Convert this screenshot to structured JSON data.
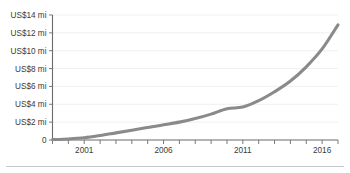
{
  "chart_data": {
    "type": "line",
    "title": "",
    "subtitle": "",
    "xlabel": "",
    "ylabel": "",
    "grid": true,
    "legend_position": "none",
    "line_color": "#8a8a8a",
    "gridline_color": "#e9ecef",
    "axis_color": "#6b6b6b",
    "xlim": [
      1999,
      2017
    ],
    "ylim": [
      0,
      14
    ],
    "y_tick_values": [
      0,
      2,
      4,
      6,
      8,
      10,
      12,
      14
    ],
    "y_tick_labels": [
      "0",
      "US$2 mi",
      "US$4 mi",
      "US$6 mi",
      "US$8 mi",
      "US$10 mi",
      "US$12 mi",
      "US$14 mi"
    ],
    "x_tick_values": [
      1999,
      2000,
      2001,
      2002,
      2003,
      2004,
      2005,
      2006,
      2007,
      2008,
      2009,
      2010,
      2011,
      2012,
      2013,
      2014,
      2015,
      2016,
      2017
    ],
    "x_tick_labels_shown": [
      {
        "value": 2001,
        "label": "2001"
      },
      {
        "value": 2006,
        "label": "2006"
      },
      {
        "value": 2011,
        "label": "2011"
      },
      {
        "value": 2016,
        "label": "2016"
      }
    ],
    "x": [
      1999,
      2000,
      2001,
      2002,
      2003,
      2004,
      2005,
      2006,
      2007,
      2008,
      2009,
      2010,
      2011,
      2012,
      2013,
      2014,
      2015,
      2016,
      2017
    ],
    "values": [
      0.05,
      0.12,
      0.25,
      0.5,
      0.8,
      1.1,
      1.4,
      1.7,
      2.0,
      2.4,
      2.9,
      3.5,
      3.7,
      4.4,
      5.4,
      6.6,
      8.2,
      10.2,
      12.9
    ],
    "series": [
      {
        "name": "value",
        "values": [
          0.05,
          0.12,
          0.25,
          0.5,
          0.8,
          1.1,
          1.4,
          1.7,
          2.0,
          2.4,
          2.9,
          3.5,
          3.7,
          4.4,
          5.4,
          6.6,
          8.2,
          10.2,
          12.9
        ]
      }
    ]
  }
}
